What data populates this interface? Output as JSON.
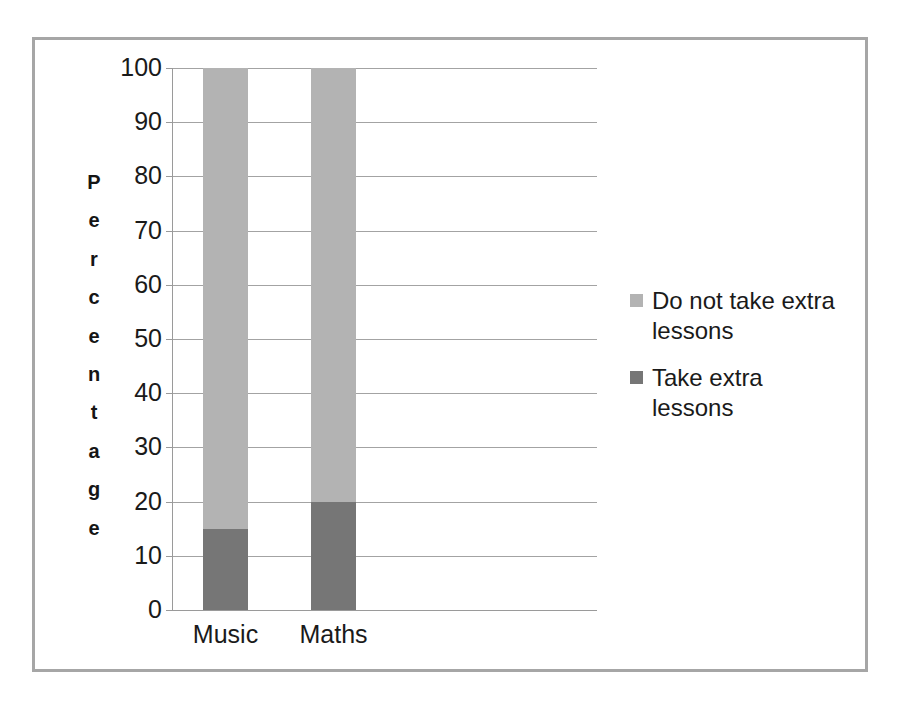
{
  "chart_data": {
    "type": "bar",
    "subtype": "stacked-column",
    "title": "",
    "xlabel": "",
    "ylabel": "Percentage",
    "categories": [
      "Music",
      "Maths"
    ],
    "series": [
      {
        "name": "Take extra lessons",
        "color": "#767676",
        "values": [
          15,
          20
        ]
      },
      {
        "name": "Do not take extra lessons",
        "color": "#b3b3b3",
        "values": [
          85,
          80
        ]
      }
    ],
    "stack_order_bottom_to_top": [
      "Take extra lessons",
      "Do not take extra lessons"
    ],
    "ylim": [
      0,
      100
    ],
    "ytick_step": 10,
    "yticks": [
      100,
      90,
      80,
      70,
      60,
      50,
      40,
      30,
      20,
      10,
      0
    ],
    "ytick_labels": [
      "100",
      "90",
      "80",
      "70",
      "60",
      "50",
      "40",
      "30",
      "20",
      "10",
      "0"
    ],
    "grid": "horizontal",
    "legend_position": "right",
    "legend_entries": [
      {
        "label": "Do not take extra lessons",
        "color": "#b3b3b3"
      },
      {
        "label": "Take extra lessons",
        "color": "#767676"
      }
    ]
  },
  "axis": {
    "y_title_letters": [
      "P",
      "e",
      "r",
      "c",
      "e",
      "n",
      "t",
      "a",
      "g",
      "e"
    ]
  },
  "colors": {
    "frame_border": "#a6a6a6",
    "gridline": "#a3a3a3",
    "axis_line": "#9a9a9a",
    "light_segment": "#b3b3b3",
    "dark_segment": "#767676",
    "text": "#1a1a1a",
    "background": "#ffffff"
  }
}
